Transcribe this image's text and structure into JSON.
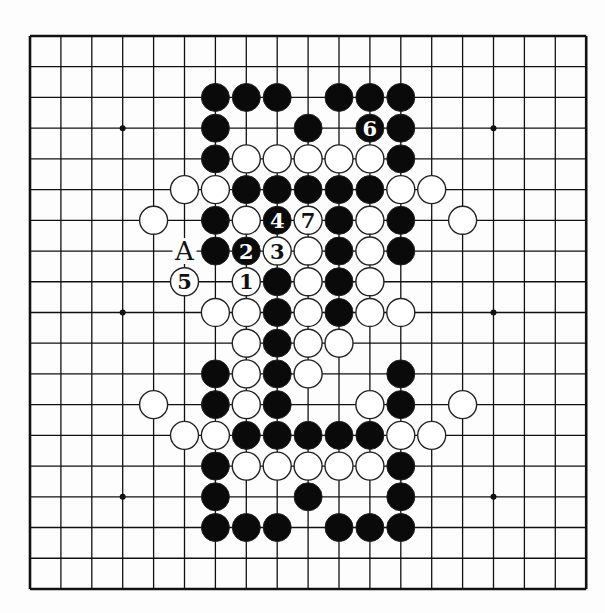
{
  "board": {
    "size": 19,
    "origin": {
      "x": 30,
      "y": 36
    },
    "spacing": {
      "x": 30.9,
      "y": 30.72
    },
    "stone_radius": 14,
    "colors": {
      "background": "#fdfdfd",
      "line": "#111111",
      "black_stone": "#0a0a0a",
      "white_stone": "#ffffff",
      "stone_outline": "#222222"
    },
    "star_points": [
      [
        3,
        3
      ],
      [
        9,
        3
      ],
      [
        15,
        3
      ],
      [
        3,
        9
      ],
      [
        15,
        9
      ],
      [
        3,
        15
      ],
      [
        15,
        15
      ]
    ],
    "stones": [
      {
        "c": 6,
        "r": 2,
        "color": "black"
      },
      {
        "c": 7,
        "r": 2,
        "color": "black"
      },
      {
        "c": 8,
        "r": 2,
        "color": "black"
      },
      {
        "c": 10,
        "r": 2,
        "color": "black"
      },
      {
        "c": 11,
        "r": 2,
        "color": "black"
      },
      {
        "c": 12,
        "r": 2,
        "color": "black"
      },
      {
        "c": 6,
        "r": 3,
        "color": "black"
      },
      {
        "c": 9,
        "r": 3,
        "color": "black"
      },
      {
        "c": 11,
        "r": 3,
        "color": "black",
        "label": "6"
      },
      {
        "c": 12,
        "r": 3,
        "color": "black"
      },
      {
        "c": 6,
        "r": 4,
        "color": "black"
      },
      {
        "c": 7,
        "r": 4,
        "color": "white"
      },
      {
        "c": 8,
        "r": 4,
        "color": "white"
      },
      {
        "c": 9,
        "r": 4,
        "color": "white"
      },
      {
        "c": 10,
        "r": 4,
        "color": "white"
      },
      {
        "c": 11,
        "r": 4,
        "color": "white"
      },
      {
        "c": 12,
        "r": 4,
        "color": "black"
      },
      {
        "c": 5,
        "r": 5,
        "color": "white"
      },
      {
        "c": 6,
        "r": 5,
        "color": "white"
      },
      {
        "c": 7,
        "r": 5,
        "color": "black"
      },
      {
        "c": 8,
        "r": 5,
        "color": "black"
      },
      {
        "c": 9,
        "r": 5,
        "color": "black"
      },
      {
        "c": 10,
        "r": 5,
        "color": "black"
      },
      {
        "c": 11,
        "r": 5,
        "color": "black"
      },
      {
        "c": 12,
        "r": 5,
        "color": "white"
      },
      {
        "c": 13,
        "r": 5,
        "color": "white"
      },
      {
        "c": 4,
        "r": 6,
        "color": "white"
      },
      {
        "c": 6,
        "r": 6,
        "color": "black"
      },
      {
        "c": 7,
        "r": 6,
        "color": "white"
      },
      {
        "c": 8,
        "r": 6,
        "color": "black",
        "label": "4"
      },
      {
        "c": 9,
        "r": 6,
        "color": "white",
        "label": "7"
      },
      {
        "c": 10,
        "r": 6,
        "color": "black"
      },
      {
        "c": 11,
        "r": 6,
        "color": "white"
      },
      {
        "c": 12,
        "r": 6,
        "color": "black"
      },
      {
        "c": 14,
        "r": 6,
        "color": "white"
      },
      {
        "c": 6,
        "r": 7,
        "color": "black"
      },
      {
        "c": 7,
        "r": 7,
        "color": "black",
        "label": "2"
      },
      {
        "c": 8,
        "r": 7,
        "color": "white",
        "label": "3"
      },
      {
        "c": 9,
        "r": 7,
        "color": "white"
      },
      {
        "c": 10,
        "r": 7,
        "color": "black"
      },
      {
        "c": 11,
        "r": 7,
        "color": "white"
      },
      {
        "c": 12,
        "r": 7,
        "color": "black"
      },
      {
        "c": 5,
        "r": 8,
        "color": "white",
        "label": "5"
      },
      {
        "c": 7,
        "r": 8,
        "color": "white",
        "label": "1"
      },
      {
        "c": 8,
        "r": 8,
        "color": "black"
      },
      {
        "c": 9,
        "r": 8,
        "color": "white"
      },
      {
        "c": 10,
        "r": 8,
        "color": "black"
      },
      {
        "c": 11,
        "r": 8,
        "color": "white"
      },
      {
        "c": 6,
        "r": 9,
        "color": "white"
      },
      {
        "c": 7,
        "r": 9,
        "color": "white"
      },
      {
        "c": 8,
        "r": 9,
        "color": "black"
      },
      {
        "c": 9,
        "r": 9,
        "color": "white"
      },
      {
        "c": 10,
        "r": 9,
        "color": "black"
      },
      {
        "c": 11,
        "r": 9,
        "color": "white"
      },
      {
        "c": 12,
        "r": 9,
        "color": "white"
      },
      {
        "c": 7,
        "r": 10,
        "color": "white"
      },
      {
        "c": 8,
        "r": 10,
        "color": "black"
      },
      {
        "c": 9,
        "r": 10,
        "color": "white"
      },
      {
        "c": 10,
        "r": 10,
        "color": "white"
      },
      {
        "c": 6,
        "r": 11,
        "color": "black"
      },
      {
        "c": 7,
        "r": 11,
        "color": "white"
      },
      {
        "c": 8,
        "r": 11,
        "color": "black"
      },
      {
        "c": 9,
        "r": 11,
        "color": "white"
      },
      {
        "c": 12,
        "r": 11,
        "color": "black"
      },
      {
        "c": 4,
        "r": 12,
        "color": "white"
      },
      {
        "c": 6,
        "r": 12,
        "color": "black"
      },
      {
        "c": 7,
        "r": 12,
        "color": "white"
      },
      {
        "c": 8,
        "r": 12,
        "color": "black"
      },
      {
        "c": 11,
        "r": 12,
        "color": "white"
      },
      {
        "c": 12,
        "r": 12,
        "color": "black"
      },
      {
        "c": 14,
        "r": 12,
        "color": "white"
      },
      {
        "c": 5,
        "r": 13,
        "color": "white"
      },
      {
        "c": 6,
        "r": 13,
        "color": "white"
      },
      {
        "c": 7,
        "r": 13,
        "color": "black"
      },
      {
        "c": 8,
        "r": 13,
        "color": "black"
      },
      {
        "c": 9,
        "r": 13,
        "color": "black"
      },
      {
        "c": 10,
        "r": 13,
        "color": "black"
      },
      {
        "c": 11,
        "r": 13,
        "color": "black"
      },
      {
        "c": 12,
        "r": 13,
        "color": "white"
      },
      {
        "c": 13,
        "r": 13,
        "color": "white"
      },
      {
        "c": 6,
        "r": 14,
        "color": "black"
      },
      {
        "c": 7,
        "r": 14,
        "color": "white"
      },
      {
        "c": 8,
        "r": 14,
        "color": "white"
      },
      {
        "c": 9,
        "r": 14,
        "color": "white"
      },
      {
        "c": 10,
        "r": 14,
        "color": "white"
      },
      {
        "c": 11,
        "r": 14,
        "color": "white"
      },
      {
        "c": 12,
        "r": 14,
        "color": "black"
      },
      {
        "c": 6,
        "r": 15,
        "color": "black"
      },
      {
        "c": 9,
        "r": 15,
        "color": "black"
      },
      {
        "c": 12,
        "r": 15,
        "color": "black"
      },
      {
        "c": 6,
        "r": 16,
        "color": "black"
      },
      {
        "c": 7,
        "r": 16,
        "color": "black"
      },
      {
        "c": 8,
        "r": 16,
        "color": "black"
      },
      {
        "c": 10,
        "r": 16,
        "color": "black"
      },
      {
        "c": 11,
        "r": 16,
        "color": "black"
      },
      {
        "c": 12,
        "r": 16,
        "color": "black"
      }
    ],
    "markers": [
      {
        "c": 5,
        "r": 7,
        "text": "A"
      }
    ]
  }
}
